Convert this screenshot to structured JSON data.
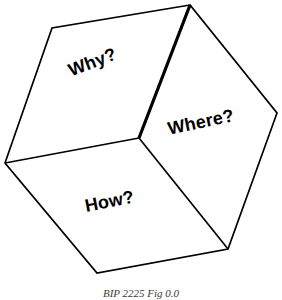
{
  "figure": {
    "type": "cube-diagram",
    "background_color": "#ffffff",
    "stroke_color": "#000000",
    "caption": "BIP  2225  Fig 0.0",
    "faces": [
      {
        "id": "top",
        "label": "Why?",
        "rotation_deg": -21
      },
      {
        "id": "right",
        "label": "Where?",
        "rotation_deg": -12
      },
      {
        "id": "front",
        "label": "How?",
        "rotation_deg": -11
      }
    ],
    "vertices": {
      "top": [
        190,
        5
      ],
      "top_left": [
        52,
        28
      ],
      "left": [
        5,
        163
      ],
      "center": [
        139,
        138
      ],
      "right": [
        277,
        113
      ],
      "bottom_left": [
        97,
        273
      ],
      "bottom_right": [
        228,
        249
      ]
    },
    "edges": {
      "outline": "M190,5 L52,28 L5,163 L97,273 L228,249 L277,113 Z",
      "spoke_top_center": "M190,5 L139,138",
      "spoke_left_center": "M5,163 L139,138",
      "spoke_right_center": "M139,138 L228,249",
      "thin_stroke_width": 1.6,
      "thick_stroke_width": 3.2
    }
  }
}
